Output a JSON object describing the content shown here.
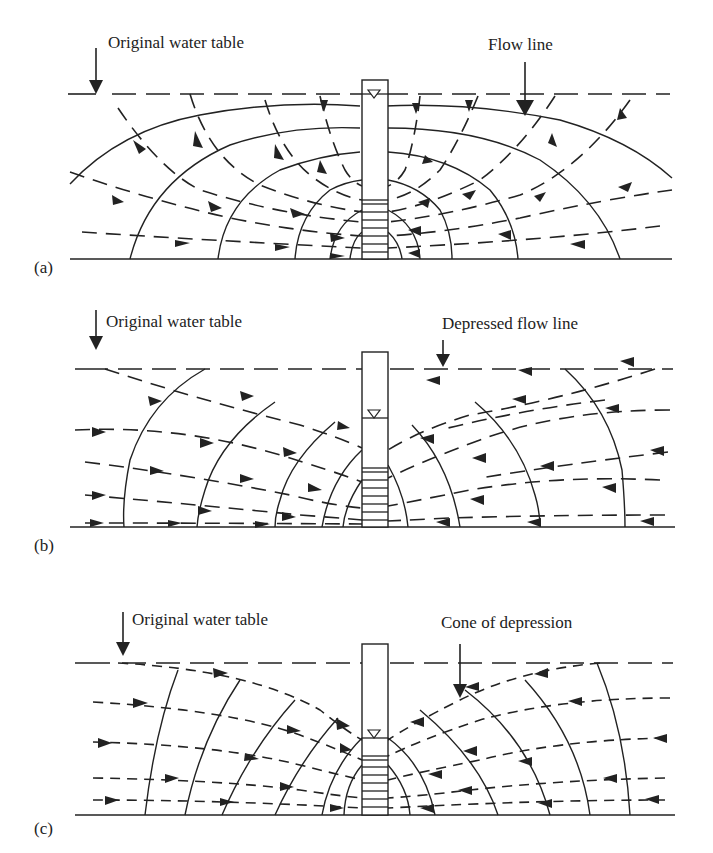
{
  "figure": {
    "panels": [
      {
        "id": "a",
        "panel_label": "(a)",
        "left_label": "Original water table",
        "right_label": "Flow line"
      },
      {
        "id": "b",
        "panel_label": "(b)",
        "left_label": "Original water table",
        "right_label": "Depressed flow line"
      },
      {
        "id": "c",
        "panel_label": "(c)",
        "left_label": "Original water table",
        "right_label": "Cone of depression"
      }
    ],
    "colors": {
      "ink": "#222222",
      "background": "#ffffff"
    },
    "symbols": {
      "water_level_marker": "inverted-triangle",
      "well_screen": "horizontal-rungs"
    }
  }
}
